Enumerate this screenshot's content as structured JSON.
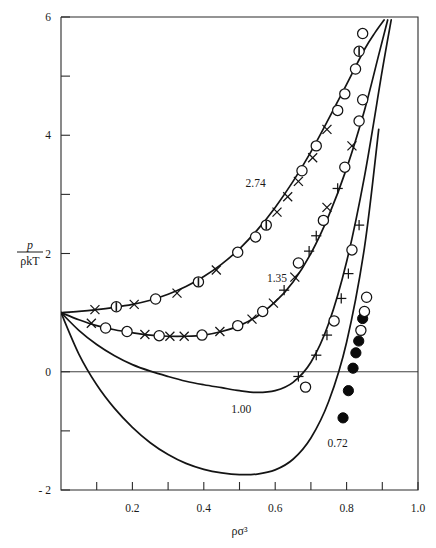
{
  "chart_data": {
    "type": "line",
    "title": "",
    "xlabel": "ρσ³",
    "ylabel_numerator": "p",
    "ylabel_denominator": "ρkT",
    "xlim": [
      0.0,
      1.0
    ],
    "ylim": [
      -2.0,
      6.0
    ],
    "grid": false,
    "legend_position": "inline-curve-labels",
    "x_ticks_major": [
      "0.2",
      "0.4",
      "0.6",
      "0.8",
      "1.0"
    ],
    "x_tick_values_major": [
      0.2,
      0.4,
      0.6,
      0.8,
      1.0
    ],
    "x_tick_values_minor": [
      0.1,
      0.3,
      0.5,
      0.7,
      0.9
    ],
    "y_ticks_major": [
      "6",
      "4",
      "2",
      "0",
      "- 2"
    ],
    "y_tick_values_major": [
      6,
      4,
      2,
      0,
      -2
    ],
    "y_tick_values_minor": [
      5,
      3,
      1,
      -1
    ],
    "zero_line_value": 0,
    "series": [
      {
        "name": "2.74",
        "label": "2.74",
        "label_x": 0.545,
        "label_y": 3.12,
        "marker": "open-circle",
        "x": [
          0.0,
          0.05,
          0.1,
          0.15,
          0.2,
          0.25,
          0.3,
          0.35,
          0.4,
          0.45,
          0.5,
          0.55,
          0.6,
          0.65,
          0.7,
          0.75,
          0.8,
          0.85,
          0.88,
          0.905
        ],
        "y": [
          1.0,
          1.02,
          1.05,
          1.09,
          1.14,
          1.21,
          1.31,
          1.44,
          1.61,
          1.82,
          2.08,
          2.4,
          2.78,
          3.22,
          3.72,
          4.28,
          4.86,
          5.45,
          5.74,
          5.95
        ],
        "points": [
          {
            "x": 0.095,
            "y": 1.05,
            "marker": "cross"
          },
          {
            "x": 0.155,
            "y": 1.1,
            "marker": "half-circle"
          },
          {
            "x": 0.205,
            "y": 1.14,
            "marker": "cross"
          },
          {
            "x": 0.265,
            "y": 1.23,
            "marker": "open-circle"
          },
          {
            "x": 0.325,
            "y": 1.33,
            "marker": "cross"
          },
          {
            "x": 0.385,
            "y": 1.52,
            "marker": "half-circle"
          },
          {
            "x": 0.435,
            "y": 1.72,
            "marker": "cross"
          },
          {
            "x": 0.495,
            "y": 2.02,
            "marker": "open-circle"
          },
          {
            "x": 0.545,
            "y": 2.28,
            "marker": "open-circle"
          },
          {
            "x": 0.575,
            "y": 2.48,
            "marker": "half-circle"
          },
          {
            "x": 0.605,
            "y": 2.7,
            "marker": "cross"
          },
          {
            "x": 0.635,
            "y": 2.96,
            "marker": "cross"
          },
          {
            "x": 0.665,
            "y": 3.22,
            "marker": "cross"
          },
          {
            "x": 0.675,
            "y": 3.4,
            "marker": "open-circle"
          },
          {
            "x": 0.705,
            "y": 3.62,
            "marker": "cross"
          },
          {
            "x": 0.715,
            "y": 3.82,
            "marker": "open-circle"
          },
          {
            "x": 0.745,
            "y": 4.1,
            "marker": "cross"
          },
          {
            "x": 0.775,
            "y": 4.42,
            "marker": "open-circle"
          },
          {
            "x": 0.795,
            "y": 4.7,
            "marker": "open-circle"
          },
          {
            "x": 0.825,
            "y": 5.12,
            "marker": "open-circle"
          },
          {
            "x": 0.835,
            "y": 5.42,
            "marker": "half-circle"
          },
          {
            "x": 0.845,
            "y": 5.72,
            "marker": "open-circle"
          }
        ]
      },
      {
        "name": "1.35",
        "label": "1.35",
        "label_x": 0.605,
        "label_y": 1.52,
        "marker": "open-circle",
        "x": [
          0.0,
          0.05,
          0.1,
          0.15,
          0.2,
          0.25,
          0.3,
          0.35,
          0.4,
          0.45,
          0.5,
          0.55,
          0.6,
          0.65,
          0.7,
          0.75,
          0.8,
          0.85,
          0.89,
          0.915
        ],
        "y": [
          1.0,
          0.88,
          0.78,
          0.71,
          0.66,
          0.62,
          0.6,
          0.6,
          0.62,
          0.68,
          0.78,
          0.94,
          1.18,
          1.52,
          2.0,
          2.64,
          3.44,
          4.42,
          5.36,
          5.95
        ],
        "points": [
          {
            "x": 0.085,
            "y": 0.82,
            "marker": "cross"
          },
          {
            "x": 0.125,
            "y": 0.74,
            "marker": "open-circle"
          },
          {
            "x": 0.185,
            "y": 0.68,
            "marker": "open-circle"
          },
          {
            "x": 0.235,
            "y": 0.63,
            "marker": "cross"
          },
          {
            "x": 0.275,
            "y": 0.61,
            "marker": "open-circle"
          },
          {
            "x": 0.305,
            "y": 0.6,
            "marker": "cross"
          },
          {
            "x": 0.345,
            "y": 0.6,
            "marker": "cross"
          },
          {
            "x": 0.395,
            "y": 0.62,
            "marker": "open-circle"
          },
          {
            "x": 0.445,
            "y": 0.68,
            "marker": "cross"
          },
          {
            "x": 0.495,
            "y": 0.78,
            "marker": "open-circle"
          },
          {
            "x": 0.535,
            "y": 0.89,
            "marker": "cross"
          },
          {
            "x": 0.565,
            "y": 1.02,
            "marker": "open-circle"
          },
          {
            "x": 0.595,
            "y": 1.16,
            "marker": "cross"
          },
          {
            "x": 0.625,
            "y": 1.38,
            "marker": "plus"
          },
          {
            "x": 0.655,
            "y": 1.6,
            "marker": "cross"
          },
          {
            "x": 0.665,
            "y": 1.84,
            "marker": "open-circle"
          },
          {
            "x": 0.695,
            "y": 2.04,
            "marker": "plus"
          },
          {
            "x": 0.715,
            "y": 2.3,
            "marker": "plus"
          },
          {
            "x": 0.735,
            "y": 2.56,
            "marker": "open-circle"
          },
          {
            "x": 0.745,
            "y": 2.78,
            "marker": "cross"
          },
          {
            "x": 0.775,
            "y": 3.1,
            "marker": "plus"
          },
          {
            "x": 0.795,
            "y": 3.46,
            "marker": "open-circle"
          },
          {
            "x": 0.815,
            "y": 3.82,
            "marker": "cross"
          },
          {
            "x": 0.835,
            "y": 4.24,
            "marker": "open-circle"
          },
          {
            "x": 0.845,
            "y": 4.6,
            "marker": "open-circle"
          }
        ]
      },
      {
        "name": "1.00",
        "label": "1.00",
        "label_x": 0.505,
        "label_y": -0.7,
        "marker": "plus",
        "x": [
          0.0,
          0.05,
          0.1,
          0.15,
          0.2,
          0.25,
          0.3,
          0.35,
          0.4,
          0.45,
          0.5,
          0.55,
          0.6,
          0.65,
          0.7,
          0.75,
          0.8,
          0.85,
          0.9,
          0.925
        ],
        "y": [
          1.0,
          0.7,
          0.46,
          0.27,
          0.12,
          0.01,
          -0.08,
          -0.16,
          -0.22,
          -0.27,
          -0.32,
          -0.35,
          -0.32,
          -0.18,
          0.16,
          0.82,
          1.86,
          3.3,
          5.1,
          5.95
        ],
        "points": [
          {
            "x": 0.665,
            "y": -0.08,
            "marker": "plus"
          },
          {
            "x": 0.685,
            "y": -0.26,
            "marker": "open-circle"
          },
          {
            "x": 0.715,
            "y": 0.28,
            "marker": "plus"
          },
          {
            "x": 0.745,
            "y": 0.62,
            "marker": "plus"
          },
          {
            "x": 0.765,
            "y": 0.86,
            "marker": "open-circle"
          },
          {
            "x": 0.785,
            "y": 1.24,
            "marker": "plus"
          },
          {
            "x": 0.805,
            "y": 1.66,
            "marker": "plus"
          },
          {
            "x": 0.815,
            "y": 2.06,
            "marker": "open-circle"
          },
          {
            "x": 0.835,
            "y": 2.48,
            "marker": "plus"
          }
        ]
      },
      {
        "name": "0.72",
        "label": "0.72",
        "label_x": 0.775,
        "label_y": -1.28,
        "marker": "filled-circle",
        "x": [
          0.0,
          0.05,
          0.1,
          0.15,
          0.2,
          0.25,
          0.3,
          0.35,
          0.4,
          0.45,
          0.5,
          0.55,
          0.6,
          0.65,
          0.7,
          0.75,
          0.8,
          0.85,
          0.89
        ],
        "y": [
          1.0,
          0.3,
          -0.22,
          -0.62,
          -0.94,
          -1.2,
          -1.4,
          -1.55,
          -1.65,
          -1.71,
          -1.74,
          -1.73,
          -1.66,
          -1.48,
          -1.12,
          -0.5,
          0.5,
          2.1,
          4.1
        ],
        "points": [
          {
            "x": 0.79,
            "y": -0.78,
            "marker": "filled-circle"
          },
          {
            "x": 0.805,
            "y": -0.32,
            "marker": "filled-circle"
          },
          {
            "x": 0.818,
            "y": 0.06,
            "marker": "filled-circle"
          },
          {
            "x": 0.826,
            "y": 0.32,
            "marker": "filled-circle"
          },
          {
            "x": 0.834,
            "y": 0.52,
            "marker": "filled-circle"
          },
          {
            "x": 0.84,
            "y": 0.7,
            "marker": "open-circle"
          },
          {
            "x": 0.845,
            "y": 0.9,
            "marker": "filled-circle"
          },
          {
            "x": 0.85,
            "y": 1.02,
            "marker": "open-circle"
          },
          {
            "x": 0.856,
            "y": 1.26,
            "marker": "open-circle"
          }
        ]
      }
    ]
  }
}
